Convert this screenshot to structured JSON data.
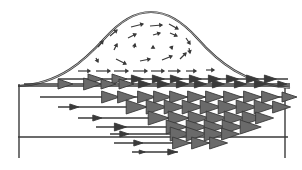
{
  "diagram": {
    "type": "flow-vector-field",
    "colors": {
      "background": "#ffffff",
      "stroke": "#3a3a3a",
      "arrow_fill": "#6a6a6a"
    },
    "outline": {
      "bump_peak": [
        151,
        12
      ],
      "bump_base_left": [
        20,
        86
      ],
      "bump_base_right": [
        290,
        88
      ],
      "channel": {
        "x": 18,
        "y": 86,
        "width": 272,
        "height": 52,
        "left_wall_bottom": 158,
        "right_wall_bottom": 158
      }
    },
    "vortex_arrows": [
      [
        131,
        27,
        143,
        24
      ],
      [
        150,
        26,
        162,
        25
      ],
      [
        169,
        24,
        178,
        29
      ],
      [
        110,
        36,
        117,
        30
      ],
      [
        128,
        38,
        136,
        34
      ],
      [
        153,
        35,
        160,
        33
      ],
      [
        170,
        33,
        177,
        36
      ],
      [
        186,
        38,
        190,
        44
      ],
      [
        98,
        47,
        103,
        41
      ],
      [
        114,
        50,
        117,
        44
      ],
      [
        134,
        48,
        135,
        44
      ],
      [
        153,
        48,
        153,
        46
      ],
      [
        171,
        46,
        172,
        49
      ],
      [
        189,
        48,
        190,
        53
      ],
      [
        96,
        58,
        98,
        62
      ],
      [
        116,
        59,
        126,
        64
      ],
      [
        140,
        61,
        150,
        59
      ],
      [
        162,
        60,
        172,
        56
      ],
      [
        180,
        59,
        186,
        53
      ],
      [
        78,
        71,
        90,
        71
      ],
      [
        96,
        71,
        110,
        71
      ],
      [
        114,
        71,
        128,
        71
      ],
      [
        133,
        71,
        147,
        71
      ],
      [
        151,
        71,
        164,
        71
      ],
      [
        168,
        71,
        180,
        71
      ],
      [
        186,
        71,
        196,
        71
      ],
      [
        206,
        70,
        214,
        70
      ]
    ],
    "vector_rows": [
      {
        "y": 79,
        "x_start": 58,
        "x_end": 288,
        "heads": [
          [
            95,
            5
          ],
          [
            119,
            5
          ],
          [
            137,
            4
          ],
          [
            158,
            4
          ],
          [
            176,
            4
          ],
          [
            195,
            4
          ],
          [
            214,
            4
          ],
          [
            232,
            4
          ],
          [
            252,
            4
          ],
          [
            270,
            4
          ]
        ]
      },
      {
        "y": 84,
        "x_start": 24,
        "x_end": 290,
        "heads": [
          [
            65,
            5
          ],
          [
            92,
            6
          ],
          [
            108,
            5
          ],
          [
            126,
            5
          ],
          [
            144,
            4
          ],
          [
            163,
            4
          ],
          [
            182,
            4
          ],
          [
            200,
            4
          ],
          [
            218,
            4
          ],
          [
            240,
            4
          ],
          [
            260,
            4
          ],
          [
            282,
            3
          ]
        ]
      },
      {
        "y": 97,
        "x_start": 40,
        "x_end": 292,
        "heads": [
          [
            110,
            6
          ],
          [
            126,
            6
          ],
          [
            146,
            6
          ],
          [
            162,
            6
          ],
          [
            178,
            6
          ],
          [
            196,
            6
          ],
          [
            214,
            6
          ],
          [
            232,
            6
          ],
          [
            252,
            6
          ],
          [
            270,
            6
          ],
          [
            289,
            5
          ]
        ]
      },
      {
        "y": 107,
        "x_start": 58,
        "x_end": 284,
        "heads": [
          [
            74,
            3
          ],
          [
            136,
            7
          ],
          [
            156,
            7
          ],
          [
            174,
            7
          ],
          [
            192,
            7
          ],
          [
            210,
            7
          ],
          [
            228,
            7
          ],
          [
            246,
            7
          ],
          [
            264,
            7
          ],
          [
            281,
            6
          ]
        ]
      },
      {
        "y": 118,
        "x_start": 78,
        "x_end": 266,
        "heads": [
          [
            97,
            3
          ],
          [
            158,
            7
          ],
          [
            178,
            7
          ],
          [
            198,
            7
          ],
          [
            216,
            7
          ],
          [
            234,
            7
          ],
          [
            252,
            7
          ],
          [
            264,
            6
          ]
        ]
      },
      {
        "y": 127,
        "x_start": 96,
        "x_end": 252,
        "heads": [
          [
            120,
            4
          ],
          [
            176,
            7
          ],
          [
            196,
            7
          ],
          [
            214,
            7
          ],
          [
            232,
            7
          ],
          [
            250,
            7
          ]
        ]
      },
      {
        "y": 134,
        "x_start": 110,
        "x_end": 232,
        "heads": [
          [
            124,
            3
          ],
          [
            180,
            7
          ],
          [
            196,
            7
          ],
          [
            214,
            7
          ],
          [
            230,
            6
          ]
        ]
      },
      {
        "y": 143,
        "x_start": 114,
        "x_end": 226,
        "heads": [
          [
            138,
            3
          ],
          [
            181,
            6
          ],
          [
            200,
            6
          ],
          [
            218,
            6
          ]
        ]
      },
      {
        "y": 152,
        "x_start": 132,
        "x_end": 178,
        "heads": [
          [
            142,
            2
          ],
          [
            172,
            3
          ]
        ]
      }
    ]
  }
}
